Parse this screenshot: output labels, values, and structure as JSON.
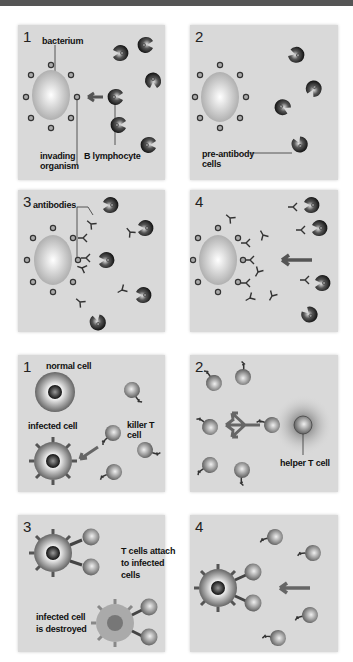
{
  "figure": {
    "sections": [
      {
        "name": "antibody-response",
        "panels": [
          {
            "number": "1",
            "labels": {
              "bacterium": "bacterium",
              "invading": "invading\norganism",
              "blymph": "B lymphocyte"
            }
          },
          {
            "number": "2",
            "labels": {
              "preab": "pre-antibody\ncells"
            }
          },
          {
            "number": "3",
            "labels": {
              "antibodies": "antibodies"
            }
          },
          {
            "number": "4",
            "labels": {}
          }
        ]
      },
      {
        "name": "t-cell-response",
        "panels": [
          {
            "number": "1",
            "labels": {
              "normal": "normal cell",
              "infected": "infected cell",
              "killer": "killer T cell"
            }
          },
          {
            "number": "2",
            "labels": {
              "helper": "helper T cell"
            }
          },
          {
            "number": "3",
            "labels": {
              "attach": "T cells attach\nto infected\ncells",
              "destroyed": "infected cell\nis destroyed"
            }
          },
          {
            "number": "4",
            "labels": {}
          }
        ]
      }
    ],
    "colors": {
      "panel_bg": "#d9d9d9",
      "dark_cell": "#2a2a2a",
      "arrow": "#666666"
    }
  }
}
